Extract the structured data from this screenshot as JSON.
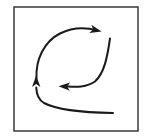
{
  "figure": {
    "description": "A rectangular frame enclosing a lens-shaped circulation pattern drawn with three curved arrows.",
    "background_color": "#ffffff",
    "ink_color": "#1a1a1a",
    "frame": {
      "name": "border-frame",
      "x": 14,
      "y": 7,
      "width": 124,
      "height": 124,
      "stroke_color": "#2b2b2b",
      "stroke_width": 1.4,
      "fill": "none"
    },
    "canvas": {
      "width": 150,
      "height": 140
    },
    "strokes": [
      {
        "id": "upper-arc",
        "label": "Upper curved arrow pointing right",
        "direction": "right",
        "path": "M 36.5 78.5 C 35.5 60.0 44.0 41.5 60.0 33.5 C 73.0 27.0 87.0 27.5 97.0 30.5",
        "stroke_width": 2.0,
        "arrowhead": {
          "name": "arrowhead-right",
          "tip_x": 101.5,
          "tip_y": 31.6,
          "angle_deg": 14,
          "length": 11.5,
          "half_width": 4.2
        }
      },
      {
        "id": "middle-arc",
        "label": "Middle curved arrow pointing left",
        "direction": "left",
        "path": "M 110.0 38.5 C 107.5 56.0 104.5 73.0 95.0 81.5 C 86.0 88.0 74.0 86.8 66.5 86.4",
        "stroke_width": 2.0,
        "arrowhead": {
          "name": "arrowhead-left",
          "tip_x": 58.5,
          "tip_y": 86.2,
          "angle_deg": 182,
          "length": 11.5,
          "half_width": 4.2
        }
      },
      {
        "id": "lower-arc",
        "label": "Lower curved arrow sweeping up to the left",
        "direction": "up",
        "path": "M 113.0 113.0 C 88.0 112.6 58.0 110.5 44.0 103.0 C 37.6 99.2 36.4 93.5 36.3 87.5",
        "stroke_width": 2.0,
        "arrowhead": {
          "name": "arrowhead-up",
          "tip_x": 36.2,
          "tip_y": 75.5,
          "angle_deg": -90,
          "length": 11.5,
          "half_width": 4.2
        }
      }
    ]
  }
}
